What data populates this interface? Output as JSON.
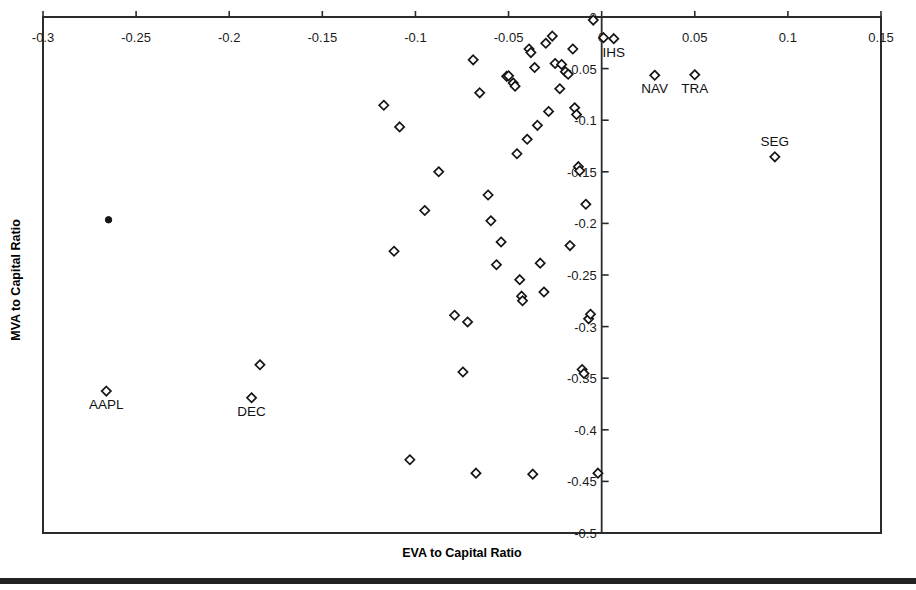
{
  "chart_data": {
    "type": "scatter",
    "title": "",
    "xlabel": "EVA to Capital Ratio",
    "ylabel": "MVA to Capital Ratio",
    "xlim": [
      -0.3,
      0.15
    ],
    "ylim": [
      -0.5,
      0.0
    ],
    "grid": false,
    "legend": "none",
    "xticks": [
      -0.3,
      -0.25,
      -0.2,
      -0.15,
      -0.1,
      -0.05,
      0,
      0.05,
      0.1,
      0.15
    ],
    "xtick_labels": [
      "-0.3",
      "-0.25",
      "-0.2",
      "-0.15",
      "-0.1",
      "-0.05",
      "0",
      "0.05",
      "0.1",
      "0.15"
    ],
    "yticks": [
      0,
      -0.05,
      -0.1,
      -0.15,
      -0.2,
      -0.25,
      -0.3,
      -0.35,
      -0.4,
      -0.45,
      -0.5
    ],
    "ytick_labels": [
      "0",
      "-0.05",
      "-0.1",
      "-0.15",
      "-0.2",
      "-0.25",
      "-0.3",
      "-0.35",
      "-0.4",
      "-0.45",
      "-0.5"
    ],
    "vertical_divider_x": 0.0,
    "marker_style": "open-diamond",
    "points": [
      {
        "x": -0.2648,
        "y": -0.1965,
        "label": "",
        "style": "dot"
      },
      {
        "x": -0.266,
        "y": -0.3625,
        "label": "AAPL",
        "label_pos": "below"
      },
      {
        "x": -0.1835,
        "y": -0.337,
        "label": "",
        "label_pos": ""
      },
      {
        "x": -0.188,
        "y": -0.369,
        "label": "DEC",
        "label_pos": "below"
      },
      {
        "x": -0.117,
        "y": -0.0855,
        "label": "",
        "label_pos": ""
      },
      {
        "x": -0.1085,
        "y": -0.1065,
        "label": "",
        "label_pos": ""
      },
      {
        "x": -0.1115,
        "y": -0.227,
        "label": "",
        "label_pos": ""
      },
      {
        "x": -0.103,
        "y": -0.429,
        "label": "",
        "label_pos": ""
      },
      {
        "x": -0.095,
        "y": -0.1875,
        "label": "",
        "label_pos": ""
      },
      {
        "x": -0.0875,
        "y": -0.15,
        "label": "",
        "label_pos": ""
      },
      {
        "x": -0.079,
        "y": -0.289,
        "label": "",
        "label_pos": ""
      },
      {
        "x": -0.0745,
        "y": -0.344,
        "label": "",
        "label_pos": ""
      },
      {
        "x": -0.072,
        "y": -0.2955,
        "label": "",
        "label_pos": ""
      },
      {
        "x": -0.069,
        "y": -0.0415,
        "label": "",
        "label_pos": ""
      },
      {
        "x": -0.0675,
        "y": -0.442,
        "label": "",
        "label_pos": ""
      },
      {
        "x": -0.0655,
        "y": -0.0735,
        "label": "",
        "label_pos": ""
      },
      {
        "x": -0.061,
        "y": -0.1725,
        "label": "",
        "label_pos": ""
      },
      {
        "x": -0.0595,
        "y": -0.1975,
        "label": "",
        "label_pos": ""
      },
      {
        "x": -0.0565,
        "y": -0.24,
        "label": "",
        "label_pos": ""
      },
      {
        "x": -0.054,
        "y": -0.218,
        "label": "",
        "label_pos": ""
      },
      {
        "x": -0.051,
        "y": -0.0575,
        "label": "",
        "label_pos": ""
      },
      {
        "x": -0.05,
        "y": -0.057,
        "label": "",
        "label_pos": ""
      },
      {
        "x": -0.0475,
        "y": -0.064,
        "label": "",
        "label_pos": ""
      },
      {
        "x": -0.0465,
        "y": -0.067,
        "label": "",
        "label_pos": ""
      },
      {
        "x": -0.0455,
        "y": -0.1325,
        "label": "",
        "label_pos": ""
      },
      {
        "x": -0.044,
        "y": -0.2545,
        "label": "",
        "label_pos": ""
      },
      {
        "x": -0.043,
        "y": -0.2705,
        "label": "",
        "label_pos": ""
      },
      {
        "x": -0.0425,
        "y": -0.275,
        "label": "",
        "label_pos": ""
      },
      {
        "x": -0.04,
        "y": -0.1185,
        "label": "",
        "label_pos": ""
      },
      {
        "x": -0.039,
        "y": -0.031,
        "label": "",
        "label_pos": ""
      },
      {
        "x": -0.038,
        "y": -0.0345,
        "label": "",
        "label_pos": ""
      },
      {
        "x": -0.037,
        "y": -0.443,
        "label": "",
        "label_pos": ""
      },
      {
        "x": -0.036,
        "y": -0.049,
        "label": "",
        "label_pos": ""
      },
      {
        "x": -0.0345,
        "y": -0.105,
        "label": "",
        "label_pos": ""
      },
      {
        "x": -0.033,
        "y": -0.2385,
        "label": "",
        "label_pos": ""
      },
      {
        "x": -0.031,
        "y": -0.2665,
        "label": "",
        "label_pos": ""
      },
      {
        "x": -0.03,
        "y": -0.0255,
        "label": "",
        "label_pos": ""
      },
      {
        "x": -0.0285,
        "y": -0.0915,
        "label": "",
        "label_pos": ""
      },
      {
        "x": -0.0265,
        "y": -0.0185,
        "label": "",
        "label_pos": ""
      },
      {
        "x": -0.025,
        "y": -0.045,
        "label": "",
        "label_pos": ""
      },
      {
        "x": -0.0225,
        "y": -0.0695,
        "label": "",
        "label_pos": ""
      },
      {
        "x": -0.0215,
        "y": -0.046,
        "label": "",
        "label_pos": ""
      },
      {
        "x": -0.0195,
        "y": -0.053,
        "label": "",
        "label_pos": ""
      },
      {
        "x": -0.018,
        "y": -0.0555,
        "label": "",
        "label_pos": ""
      },
      {
        "x": -0.017,
        "y": -0.2215,
        "label": "",
        "label_pos": ""
      },
      {
        "x": -0.0155,
        "y": -0.031,
        "label": "",
        "label_pos": ""
      },
      {
        "x": -0.0145,
        "y": -0.088,
        "label": "",
        "label_pos": ""
      },
      {
        "x": -0.0135,
        "y": -0.0945,
        "label": "",
        "label_pos": ""
      },
      {
        "x": -0.0125,
        "y": -0.145,
        "label": "",
        "label_pos": ""
      },
      {
        "x": -0.0118,
        "y": -0.149,
        "label": "",
        "label_pos": ""
      },
      {
        "x": -0.0105,
        "y": -0.3415,
        "label": "",
        "label_pos": ""
      },
      {
        "x": -0.0095,
        "y": -0.3455,
        "label": "",
        "label_pos": ""
      },
      {
        "x": -0.0085,
        "y": -0.1815,
        "label": "",
        "label_pos": ""
      },
      {
        "x": -0.007,
        "y": -0.2925,
        "label": "",
        "label_pos": ""
      },
      {
        "x": -0.006,
        "y": -0.288,
        "label": "",
        "label_pos": ""
      },
      {
        "x": -0.0045,
        "y": -0.003,
        "label": "",
        "label_pos": ""
      },
      {
        "x": -0.002,
        "y": -0.442,
        "label": "",
        "label_pos": ""
      },
      {
        "x": 0.001,
        "y": -0.02,
        "label": "",
        "label_pos": ""
      },
      {
        "x": 0.0065,
        "y": -0.021,
        "label": "IHS",
        "label_pos": "below"
      },
      {
        "x": 0.0285,
        "y": -0.0565,
        "label": "NAV",
        "label_pos": "below"
      },
      {
        "x": 0.05,
        "y": -0.056,
        "label": "TRA",
        "label_pos": "below"
      },
      {
        "x": 0.093,
        "y": -0.1355,
        "label": "SEG",
        "label_pos": "above"
      }
    ]
  },
  "axes": {
    "x_title": "EVA to Capital Ratio",
    "y_title": "MVA to Capital Ratio"
  },
  "colors": {
    "frame": "#2b2b2b",
    "marker_stroke": "#151515",
    "marker_fill": "#ffffff",
    "text": "#111111",
    "rule": "#222222"
  }
}
